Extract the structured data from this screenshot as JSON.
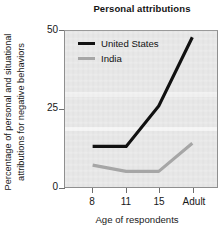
{
  "chart_data": {
    "type": "line",
    "title": "Personal attributions",
    "xlabel": "Age of respondents",
    "ylabel_line1": "Percentage of personal and situational",
    "ylabel_line2": "attributions for negative behaviors",
    "categories": [
      "8",
      "11",
      "15",
      "Adult"
    ],
    "series": [
      {
        "name": "United States",
        "color": "#111111",
        "values": [
          13,
          13,
          26,
          48
        ]
      },
      {
        "name": "India",
        "color": "#a6a6a6",
        "values": [
          7,
          5,
          5,
          14
        ]
      }
    ],
    "ylim": [
      0,
      50
    ],
    "yticks": [
      0,
      25,
      50
    ],
    "ytick_labels": [
      "0",
      "25",
      "50"
    ],
    "grid": false,
    "legend_position": "top-left",
    "plot_background": "#e7e7e7",
    "axis_color": "#8f8f8f"
  },
  "legend": {
    "entries": [
      {
        "label": "United States"
      },
      {
        "label": "India"
      }
    ]
  }
}
